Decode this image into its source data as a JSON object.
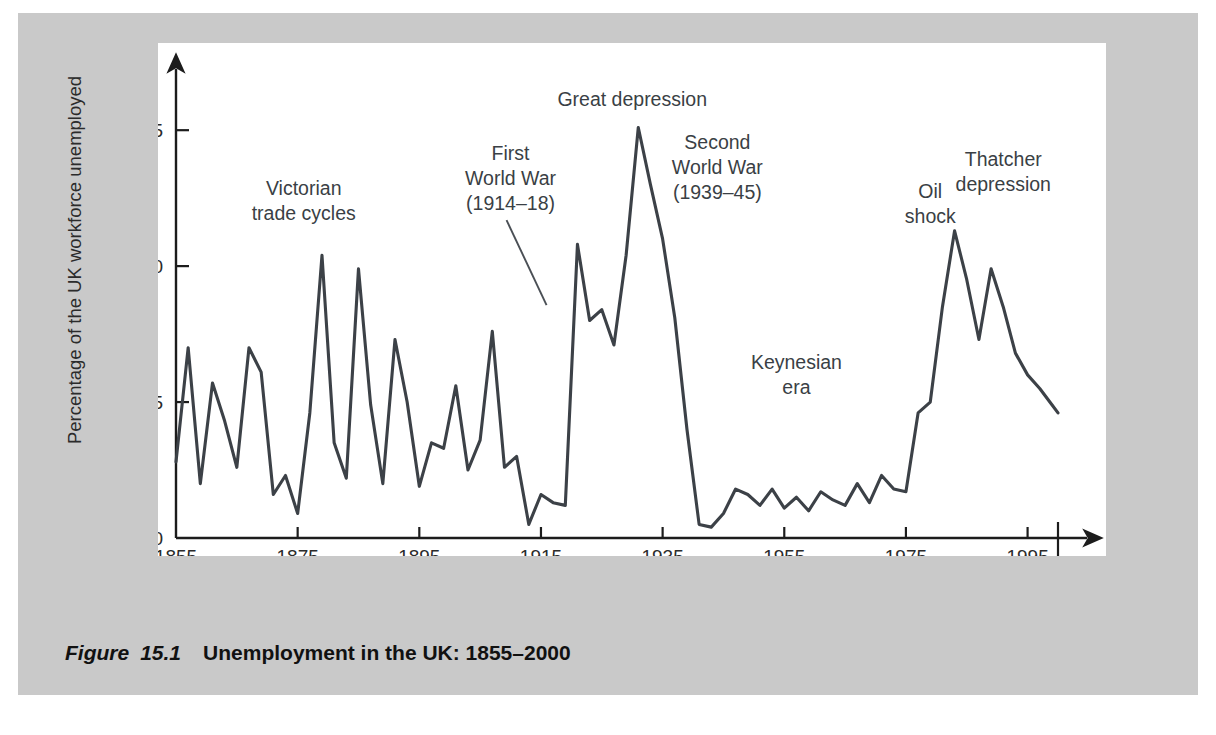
{
  "figure": {
    "caption_label": "Figure",
    "caption_number": "15.1",
    "caption_title": "Unemployment in the UK: 1855–2000",
    "panel_color": "#c9c9c9",
    "plot_background": "#ffffff",
    "line_color": "#3c4147",
    "axis_color": "#1c1c1c",
    "text_color": "#2b2b2b"
  },
  "chart_data": {
    "type": "line",
    "title": "Unemployment in the UK: 1855–2000",
    "xlabel": "",
    "ylabel": "Percentage of the UK workforce unemployed",
    "xlim": [
      1855,
      2000
    ],
    "ylim": [
      0,
      16
    ],
    "grid": false,
    "legend": "none",
    "xticks": [
      1855,
      1875,
      1895,
      1915,
      1935,
      1955,
      1975,
      1995,
      2000
    ],
    "xticklabels": [
      "1855",
      "1875",
      "1895",
      "1915",
      "1935",
      "1955",
      "1975",
      "1995",
      "2000"
    ],
    "yticks": [
      0,
      5,
      10,
      15
    ],
    "yticklabels": [
      "0",
      "5",
      "10",
      "15"
    ],
    "series": [
      {
        "name": "UK unemployment rate",
        "units": "percent",
        "x": [
          1855,
          1857,
          1859,
          1861,
          1863,
          1865,
          1867,
          1869,
          1871,
          1873,
          1875,
          1877,
          1879,
          1881,
          1883,
          1885,
          1887,
          1889,
          1891,
          1893,
          1895,
          1897,
          1899,
          1901,
          1903,
          1905,
          1907,
          1909,
          1911,
          1913,
          1915,
          1917,
          1919,
          1921,
          1923,
          1925,
          1927,
          1929,
          1931,
          1933,
          1935,
          1937,
          1939,
          1941,
          1943,
          1945,
          1947,
          1949,
          1951,
          1953,
          1955,
          1957,
          1959,
          1961,
          1963,
          1965,
          1967,
          1969,
          1971,
          1973,
          1975,
          1977,
          1979,
          1981,
          1983,
          1985,
          1987,
          1989,
          1991,
          1993,
          1995,
          1997,
          1999,
          2000
        ],
        "y": [
          2.8,
          7.0,
          2.0,
          5.7,
          4.3,
          2.6,
          7.0,
          6.1,
          1.6,
          2.3,
          0.9,
          4.6,
          10.4,
          3.5,
          2.2,
          9.9,
          4.9,
          2.0,
          7.3,
          5.0,
          1.9,
          3.5,
          3.3,
          5.6,
          2.5,
          3.6,
          7.6,
          2.6,
          3.0,
          0.5,
          1.6,
          1.3,
          1.2,
          10.8,
          8.0,
          8.4,
          7.1,
          10.4,
          15.1,
          13.0,
          11.0,
          8.1,
          4.0,
          0.5,
          0.4,
          0.9,
          1.8,
          1.6,
          1.2,
          1.8,
          1.1,
          1.5,
          1.0,
          1.7,
          1.4,
          1.2,
          2.0,
          1.3,
          2.3,
          1.8,
          1.7,
          4.6,
          5.0,
          8.5,
          11.3,
          9.5,
          7.3,
          9.9,
          8.5,
          6.8,
          6.0,
          5.5,
          4.9,
          4.6
        ]
      }
    ],
    "annotations": [
      {
        "id": "victorian",
        "text_lines": [
          "Victorian",
          "trade cycles"
        ],
        "x": 1876,
        "y": 12.6,
        "leader": false
      },
      {
        "id": "first-world-war",
        "text_lines": [
          "First",
          "World War",
          "(1914–18)"
        ],
        "x": 1910,
        "y": 13.9,
        "leader": true
      },
      {
        "id": "great-depression",
        "text_lines": [
          "Great depression"
        ],
        "x": 1930,
        "y": 15.9,
        "leader": false
      },
      {
        "id": "second-world-war",
        "text_lines": [
          "Second",
          "World War",
          "(1939–45)"
        ],
        "x": 1944,
        "y": 14.3,
        "leader": false
      },
      {
        "id": "keynesian-era",
        "text_lines": [
          "Keynesian",
          "era"
        ],
        "x": 1957,
        "y": 6.2,
        "leader": false
      },
      {
        "id": "oil-shock",
        "text_lines": [
          "Oil",
          "shock"
        ],
        "x": 1979,
        "y": 12.5,
        "leader": false
      },
      {
        "id": "thatcher-depression",
        "text_lines": [
          "Thatcher",
          "depression"
        ],
        "x": 1991,
        "y": 13.7,
        "leader": false
      }
    ],
    "year_2000_marker": {
      "year": 2000,
      "label": "2000"
    }
  }
}
